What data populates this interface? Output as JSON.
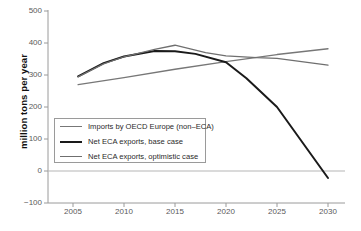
{
  "chart_data": {
    "type": "line",
    "title": "",
    "xlabel": "",
    "ylabel": "million tons per year",
    "xlim": [
      2004,
      2031
    ],
    "ylim": [
      -100,
      500
    ],
    "ytick_labels": [
      "500",
      "400",
      "300",
      "200",
      "100",
      "0",
      "−100"
    ],
    "ytick_values": [
      500,
      400,
      300,
      200,
      100,
      0,
      -100
    ],
    "xtick_labels": [
      "2005",
      "2010",
      "2015",
      "2020",
      "2025",
      "2030"
    ],
    "xtick_values": [
      2005,
      2010,
      2015,
      2020,
      2025,
      2030
    ],
    "grid": false,
    "legend_position": "center-left",
    "zero_line": 0,
    "series": [
      {
        "name": "Imports by OECD Europe (non–ECA)",
        "color": "#777777",
        "width": 1.3,
        "x": [
          2005.5,
          2010,
          2015,
          2020,
          2025,
          2030
        ],
        "values": [
          270,
          292,
          318,
          342,
          364,
          382
        ]
      },
      {
        "name": "Net ECA exports, base case",
        "color": "#1a1a1a",
        "width": 2.0,
        "x": [
          2005.5,
          2008,
          2010,
          2013,
          2015,
          2017,
          2020,
          2022,
          2025,
          2030
        ],
        "values": [
          296,
          337,
          358,
          375,
          374,
          366,
          340,
          290,
          200,
          -22
        ]
      },
      {
        "name": "Net ECA exports, optimistic case",
        "color": "#6f6f6f",
        "width": 1.3,
        "x": [
          2005.5,
          2008,
          2010,
          2013,
          2015,
          2018,
          2020,
          2023,
          2025,
          2030
        ],
        "values": [
          294,
          335,
          357,
          380,
          393,
          370,
          360,
          354,
          352,
          331
        ]
      }
    ]
  },
  "legend": {
    "items": [
      {
        "label": "Imports by OECD Europe (non–ECA)",
        "color": "#777777",
        "width": 1.6
      },
      {
        "label": "Net ECA exports, base case",
        "color": "#1a1a1a",
        "width": 2.4
      },
      {
        "label": "Net ECA exports, optimistic case",
        "color": "#6f6f6f",
        "width": 1.6
      }
    ]
  },
  "axes": {
    "ylabel": "million tons per year"
  }
}
